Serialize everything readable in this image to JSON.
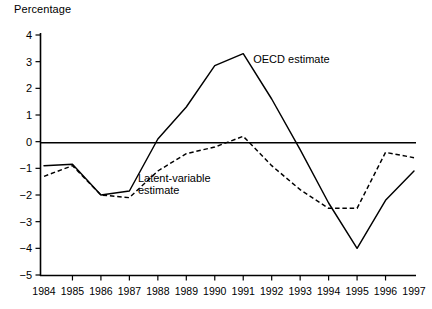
{
  "chart_data": {
    "type": "line",
    "title": "",
    "ylabel": "Percentage",
    "xlabel": "",
    "ylim": [
      -5,
      4
    ],
    "yticks": [
      4,
      3,
      2,
      1,
      0,
      -1,
      -2,
      -3,
      -4,
      -5
    ],
    "ytick_labels": [
      "4",
      "3",
      "2",
      "1",
      "0",
      "−1",
      "−2",
      "−3",
      "−4",
      "−5"
    ],
    "grid": false,
    "legend_position": "inline-annotation",
    "zero_reference_line": true,
    "categories": [
      1984,
      1985,
      1986,
      1987,
      1988,
      1989,
      1990,
      1991,
      1992,
      1993,
      1994,
      1995,
      1996,
      1997
    ],
    "xtick_labels": [
      "1984",
      "1985",
      "1986",
      "1987",
      "1988",
      "1989",
      "1990",
      "1991",
      "1992",
      "1993",
      "1994",
      "1995",
      "1996",
      "1997"
    ],
    "series": [
      {
        "name": "OECD estimate",
        "style": "solid",
        "color": "#000000",
        "values": [
          -0.9,
          -0.85,
          -2.0,
          -1.85,
          0.1,
          1.3,
          2.85,
          3.3,
          1.6,
          -0.3,
          -2.3,
          -4.0,
          -2.2,
          -1.1
        ]
      },
      {
        "name": "Latent-variable estimate",
        "style": "dashed",
        "color": "#000000",
        "values": [
          -1.3,
          -0.9,
          -2.0,
          -2.1,
          -1.1,
          -0.45,
          -0.2,
          0.2,
          -0.9,
          -1.8,
          -2.5,
          -2.5,
          -0.4,
          -0.6
        ]
      }
    ],
    "annotations": [
      {
        "text": "OECD estimate",
        "line1": "OECD estimate",
        "line2": "",
        "x": 1991.35,
        "y": 2.95
      },
      {
        "text": "Latent-variable estimate",
        "line1": "Latent-variable",
        "line2": "estimate",
        "x": 1987.3,
        "y": -1.52
      }
    ]
  }
}
